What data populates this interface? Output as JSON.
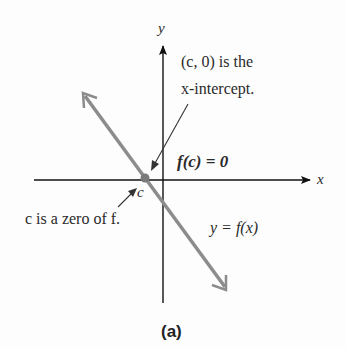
{
  "figure": {
    "caption": "(a)",
    "axes": {
      "x_label": "x",
      "y_label": "y"
    },
    "annotations": {
      "intercept_line1": "(c, 0) is the",
      "intercept_line2": "x-intercept.",
      "fc_eq": "f(c) = 0",
      "point_label": "c",
      "zero_text": "c is a zero of f.",
      "curve_label": "y = f(x)"
    },
    "colors": {
      "axis": "#111111",
      "line": "#8c8c8c",
      "text": "#2a2a2a"
    }
  }
}
